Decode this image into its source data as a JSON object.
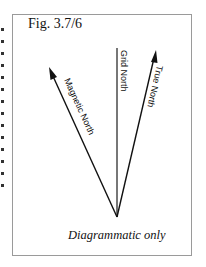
{
  "figure": {
    "title": "Fig. 3.7/6",
    "caption": "Diagrammatic only",
    "labels": {
      "magnetic_north": "Magnetic North",
      "grid_north": "Grid North",
      "true_north": "True North"
    },
    "colors": {
      "line": "#111111",
      "grid_line": "#555555",
      "frame": "#9a9a9a"
    }
  }
}
